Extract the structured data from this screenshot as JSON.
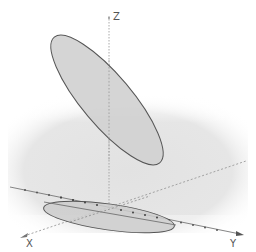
{
  "diagram": {
    "type": "3d-geometry-view",
    "axes": {
      "x_label": "X",
      "y_label": "Y",
      "z_label": "Z"
    },
    "objects": [
      {
        "name": "tilted-ellipse",
        "kind": "ellipse",
        "fill": "#d3d3d3",
        "stroke": "#555555"
      },
      {
        "name": "projected-ellipse",
        "kind": "ellipse",
        "fill": "#cfcfcf",
        "stroke": "#555555"
      }
    ],
    "colors": {
      "background": "#ffffff",
      "ground_plane": "#e4e4e4",
      "axis": "#8a8a8a",
      "ellipse_fill": "#d2d2d2",
      "ellipse_stroke": "#555555"
    }
  }
}
